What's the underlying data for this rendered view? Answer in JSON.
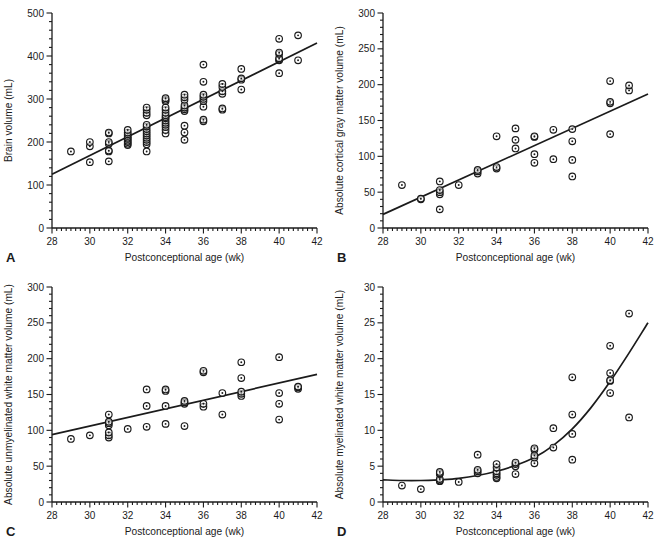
{
  "figure": {
    "background": "#ffffff",
    "ink_color": "#1b1b1b",
    "marker": "open-circle-with-center-dot"
  },
  "chart_data": [
    {
      "type": "scatter",
      "panel_label": "A",
      "title": "",
      "xlabel": "Postconceptional age (wk)",
      "ylabel": "Brain volume (mL)",
      "xlim": [
        28,
        42
      ],
      "ylim": [
        0,
        500
      ],
      "x_ticks": [
        28,
        30,
        32,
        34,
        36,
        38,
        40,
        42
      ],
      "y_ticks": [
        0,
        100,
        200,
        300,
        400,
        500
      ],
      "x_minor_step": 0.25,
      "y_minor_step": 20,
      "grid": false,
      "fit": {
        "kind": "linear",
        "points": [
          [
            28,
            125
          ],
          [
            42,
            430
          ]
        ]
      },
      "points": [
        [
          29,
          178
        ],
        [
          30,
          153
        ],
        [
          30,
          190
        ],
        [
          30,
          200
        ],
        [
          31,
          155
        ],
        [
          31,
          178
        ],
        [
          31,
          180
        ],
        [
          31,
          196
        ],
        [
          31,
          200
        ],
        [
          31,
          220
        ],
        [
          31,
          222
        ],
        [
          32,
          193
        ],
        [
          32,
          196
        ],
        [
          32,
          200
        ],
        [
          32,
          203
        ],
        [
          32,
          207
        ],
        [
          32,
          210
        ],
        [
          32,
          214
        ],
        [
          32,
          218
        ],
        [
          32,
          222
        ],
        [
          32,
          228
        ],
        [
          33,
          178
        ],
        [
          33,
          195
        ],
        [
          33,
          200
        ],
        [
          33,
          205
        ],
        [
          33,
          210
        ],
        [
          33,
          215
        ],
        [
          33,
          220
        ],
        [
          33,
          225
        ],
        [
          33,
          230
        ],
        [
          33,
          236
        ],
        [
          33,
          240
        ],
        [
          33,
          262
        ],
        [
          33,
          268
        ],
        [
          33,
          275
        ],
        [
          33,
          280
        ],
        [
          34,
          220
        ],
        [
          34,
          228
        ],
        [
          34,
          235
        ],
        [
          34,
          240
        ],
        [
          34,
          245
        ],
        [
          34,
          250
        ],
        [
          34,
          255
        ],
        [
          34,
          258
        ],
        [
          34,
          262
        ],
        [
          34,
          268
        ],
        [
          34,
          275
        ],
        [
          34,
          280
        ],
        [
          34,
          295
        ],
        [
          34,
          298
        ],
        [
          34,
          302
        ],
        [
          35,
          205
        ],
        [
          35,
          222
        ],
        [
          35,
          238
        ],
        [
          35,
          272
        ],
        [
          35,
          276
        ],
        [
          35,
          280
        ],
        [
          35,
          285
        ],
        [
          35,
          298
        ],
        [
          35,
          304
        ],
        [
          35,
          310
        ],
        [
          36,
          248
        ],
        [
          36,
          252
        ],
        [
          36,
          282
        ],
        [
          36,
          295
        ],
        [
          36,
          300
        ],
        [
          36,
          305
        ],
        [
          36,
          310
        ],
        [
          36,
          340
        ],
        [
          36,
          380
        ],
        [
          37,
          275
        ],
        [
          37,
          278
        ],
        [
          37,
          312
        ],
        [
          37,
          318
        ],
        [
          37,
          328
        ],
        [
          37,
          335
        ],
        [
          38,
          322
        ],
        [
          38,
          345
        ],
        [
          38,
          348
        ],
        [
          38,
          370
        ],
        [
          40,
          360
        ],
        [
          40,
          390
        ],
        [
          40,
          392
        ],
        [
          40,
          395
        ],
        [
          40,
          405
        ],
        [
          40,
          408
        ],
        [
          40,
          440
        ],
        [
          41,
          390
        ],
        [
          41,
          448
        ]
      ]
    },
    {
      "type": "scatter",
      "panel_label": "B",
      "title": "",
      "xlabel": "Postconceptional age (wk)",
      "ylabel": "Absolute cortical gray matter volume (mL)",
      "xlim": [
        28,
        42
      ],
      "ylim": [
        0,
        300
      ],
      "x_ticks": [
        28,
        30,
        32,
        34,
        36,
        38,
        40,
        42
      ],
      "y_ticks": [
        0,
        50,
        100,
        150,
        200,
        250,
        300
      ],
      "x_minor_step": 0.25,
      "y_minor_step": 10,
      "grid": false,
      "fit": {
        "kind": "linear",
        "points": [
          [
            28,
            19
          ],
          [
            42,
            187
          ]
        ]
      },
      "points": [
        [
          29,
          60
        ],
        [
          30,
          40
        ],
        [
          30,
          41
        ],
        [
          31,
          26
        ],
        [
          31,
          47
        ],
        [
          31,
          50
        ],
        [
          31,
          53
        ],
        [
          31,
          65
        ],
        [
          32,
          60
        ],
        [
          33,
          76
        ],
        [
          33,
          79
        ],
        [
          33,
          81
        ],
        [
          34,
          83
        ],
        [
          34,
          85
        ],
        [
          34,
          128
        ],
        [
          35,
          111
        ],
        [
          35,
          123
        ],
        [
          35,
          139
        ],
        [
          36,
          91
        ],
        [
          36,
          103
        ],
        [
          36,
          127
        ],
        [
          36,
          128
        ],
        [
          37,
          96
        ],
        [
          37,
          137
        ],
        [
          38,
          72
        ],
        [
          38,
          95
        ],
        [
          38,
          121
        ],
        [
          38,
          138
        ],
        [
          40,
          131
        ],
        [
          40,
          174
        ],
        [
          40,
          176
        ],
        [
          40,
          205
        ],
        [
          41,
          192
        ],
        [
          41,
          199
        ]
      ]
    },
    {
      "type": "scatter",
      "panel_label": "C",
      "title": "",
      "xlabel": "Postconceptional age (wk)",
      "ylabel": "Absolute unmyelinated white matter volume (mL)",
      "xlim": [
        28,
        42
      ],
      "ylim": [
        0,
        300
      ],
      "x_ticks": [
        28,
        30,
        32,
        34,
        36,
        38,
        40,
        42
      ],
      "y_ticks": [
        0,
        50,
        100,
        150,
        200,
        250,
        300
      ],
      "x_minor_step": 0.25,
      "y_minor_step": 10,
      "grid": false,
      "fit": {
        "kind": "linear",
        "points": [
          [
            28,
            94
          ],
          [
            42,
            178
          ]
        ]
      },
      "points": [
        [
          29,
          88
        ],
        [
          30,
          93
        ],
        [
          31,
          90
        ],
        [
          31,
          93
        ],
        [
          31,
          97
        ],
        [
          31,
          107
        ],
        [
          31,
          110
        ],
        [
          31,
          112
        ],
        [
          31,
          122
        ],
        [
          32,
          102
        ],
        [
          33,
          105
        ],
        [
          33,
          134
        ],
        [
          33,
          157
        ],
        [
          34,
          109
        ],
        [
          34,
          134
        ],
        [
          34,
          155
        ],
        [
          34,
          157
        ],
        [
          35,
          106
        ],
        [
          35,
          137
        ],
        [
          35,
          139
        ],
        [
          35,
          141
        ],
        [
          36,
          133
        ],
        [
          36,
          137
        ],
        [
          36,
          181
        ],
        [
          36,
          183
        ],
        [
          37,
          122
        ],
        [
          37,
          152
        ],
        [
          38,
          148
        ],
        [
          38,
          151
        ],
        [
          38,
          154
        ],
        [
          38,
          173
        ],
        [
          38,
          195
        ],
        [
          40,
          115
        ],
        [
          40,
          137
        ],
        [
          40,
          152
        ],
        [
          40,
          202
        ],
        [
          41,
          158
        ],
        [
          41,
          160
        ],
        [
          41,
          161
        ]
      ]
    },
    {
      "type": "scatter",
      "panel_label": "D",
      "title": "",
      "xlabel": "Postconceptional age (wk)",
      "ylabel": "Absolute myelinated white matter volume (mL)",
      "xlim": [
        28,
        42
      ],
      "ylim": [
        0,
        30
      ],
      "x_ticks": [
        28,
        30,
        32,
        34,
        36,
        38,
        40,
        42
      ],
      "y_ticks": [
        0,
        5,
        10,
        15,
        20,
        25,
        30
      ],
      "x_minor_step": 0.25,
      "y_minor_step": 1,
      "grid": false,
      "fit": {
        "kind": "curve",
        "points": [
          [
            28,
            3.1
          ],
          [
            29,
            3.0
          ],
          [
            30,
            3.0
          ],
          [
            31,
            3.1
          ],
          [
            32,
            3.3
          ],
          [
            33,
            3.7
          ],
          [
            34,
            4.3
          ],
          [
            35,
            5.1
          ],
          [
            36,
            6.2
          ],
          [
            37,
            7.9
          ],
          [
            38,
            10.2
          ],
          [
            39,
            13.2
          ],
          [
            40,
            16.8
          ],
          [
            41,
            20.8
          ],
          [
            42,
            25.0
          ]
        ]
      },
      "points": [
        [
          29,
          2.3
        ],
        [
          30,
          1.8
        ],
        [
          31,
          2.9
        ],
        [
          31,
          3.0
        ],
        [
          31,
          3.2
        ],
        [
          31,
          3.9
        ],
        [
          31,
          4.0
        ],
        [
          31,
          4.2
        ],
        [
          32,
          2.8
        ],
        [
          33,
          4.0
        ],
        [
          33,
          4.3
        ],
        [
          33,
          4.5
        ],
        [
          33,
          6.6
        ],
        [
          34,
          3.3
        ],
        [
          34,
          3.5
        ],
        [
          34,
          3.8
        ],
        [
          34,
          4.0
        ],
        [
          34,
          4.3
        ],
        [
          34,
          4.8
        ],
        [
          34,
          5.3
        ],
        [
          35,
          3.9
        ],
        [
          35,
          5.0
        ],
        [
          35,
          5.3
        ],
        [
          35,
          5.5
        ],
        [
          36,
          5.4
        ],
        [
          36,
          6.2
        ],
        [
          36,
          6.5
        ],
        [
          36,
          7.3
        ],
        [
          36,
          7.5
        ],
        [
          37,
          7.6
        ],
        [
          37,
          10.3
        ],
        [
          38,
          5.9
        ],
        [
          38,
          9.5
        ],
        [
          38,
          12.2
        ],
        [
          38,
          17.4
        ],
        [
          40,
          15.2
        ],
        [
          40,
          16.9
        ],
        [
          40,
          17.0
        ],
        [
          40,
          18.0
        ],
        [
          40,
          21.8
        ],
        [
          41,
          11.8
        ],
        [
          41,
          26.3
        ]
      ]
    }
  ]
}
